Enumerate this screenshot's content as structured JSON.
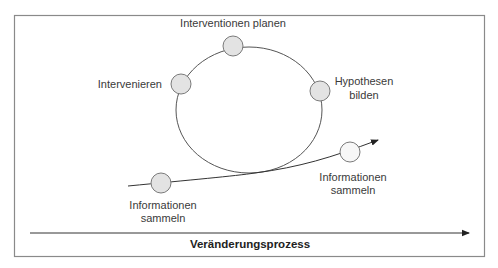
{
  "diagram": {
    "cycle_nodes": [
      {
        "id": "interventionen-planen",
        "label_lines": [
          "Interventionen planen"
        ],
        "fill": "#e3e3e3"
      },
      {
        "id": "intervenieren",
        "label_lines": [
          "Intervenieren"
        ],
        "fill": "#e3e3e3"
      },
      {
        "id": "hypothesen-bilden",
        "label_lines": [
          "Hypothesen",
          "bilden"
        ],
        "fill": "#e3e3e3"
      }
    ],
    "path_nodes": [
      {
        "id": "informationen-sammeln-start",
        "label_lines": [
          "Informationen",
          "sammeln"
        ],
        "fill": "#e3e3e3"
      },
      {
        "id": "informationen-sammeln-end",
        "label_lines": [
          "Informationen",
          "sammeln"
        ],
        "fill": "#f7f7f7"
      }
    ],
    "axis_label": "Veränderungsprozess",
    "colors": {
      "line": "#555555",
      "frame": "#8a8a8a",
      "node_stroke": "#7a7a7a"
    }
  }
}
